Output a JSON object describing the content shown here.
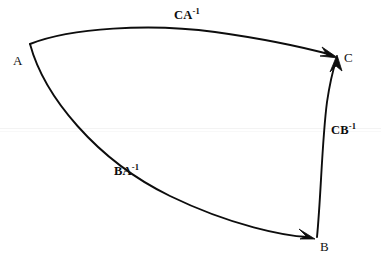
{
  "diagram": {
    "kind": "curvilinear-triangle-arrow-diagram",
    "background_color": "#ffffff",
    "stroke_color": "#0d0d0d",
    "vertices": [
      {
        "id": "A",
        "label": "A",
        "x": 30,
        "y": 44,
        "label_x": 13,
        "label_y": 54
      },
      {
        "id": "C",
        "label": "C",
        "x": 337,
        "y": 57,
        "label_x": 344,
        "label_y": 51
      },
      {
        "id": "B",
        "label": "B",
        "x": 316,
        "y": 238,
        "label_x": 320,
        "label_y": 240
      }
    ],
    "edges": [
      {
        "id": "CA-inverse",
        "base": "CA",
        "exponent": "-1",
        "from": "A",
        "to": "C",
        "arrow_at": "C",
        "label_x": 174,
        "label_y": 9
      },
      {
        "id": "CB-inverse",
        "base": "CB",
        "exponent": "-1",
        "from": "B",
        "to": "C",
        "arrow_at": "C",
        "label_x": 331,
        "label_y": 124
      },
      {
        "id": "BA-inverse",
        "base": "BA",
        "exponent": "-1",
        "from": "A",
        "to": "B",
        "arrow_at": "B",
        "label_x": 114,
        "label_y": 165
      }
    ]
  }
}
